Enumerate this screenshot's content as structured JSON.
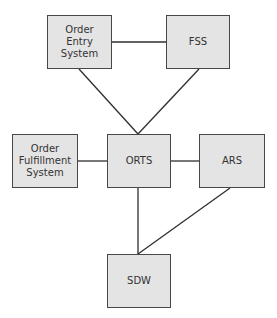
{
  "diagram": {
    "type": "system-architecture",
    "colors": {
      "node_fill": "#e4e4e4",
      "node_border": "#474747",
      "edge": "#2e2e2e",
      "text": "#333333"
    },
    "nodes": [
      {
        "id": "oes",
        "label": "Order\nEntry\nSystem",
        "x": 47,
        "y": 15,
        "w": 65,
        "h": 54
      },
      {
        "id": "fss",
        "label": "FSS",
        "x": 166,
        "y": 15,
        "w": 64,
        "h": 54
      },
      {
        "id": "ofs",
        "label": "Order\nFulfillment\nSystem",
        "x": 12,
        "y": 134,
        "w": 66,
        "h": 54
      },
      {
        "id": "orts",
        "label": "ORTS",
        "x": 107,
        "y": 134,
        "w": 64,
        "h": 54
      },
      {
        "id": "ars",
        "label": "ARS",
        "x": 199,
        "y": 134,
        "w": 66,
        "h": 54
      },
      {
        "id": "sdw",
        "label": "SDW",
        "x": 107,
        "y": 254,
        "w": 64,
        "h": 54
      }
    ],
    "edges": [
      {
        "from": "oes",
        "to": "fss",
        "x1": 112,
        "y1": 42,
        "x2": 166,
        "y2": 42
      },
      {
        "from": "oes",
        "to": "orts",
        "x1": 79,
        "y1": 69,
        "x2": 138,
        "y2": 134
      },
      {
        "from": "fss",
        "to": "orts",
        "x1": 199,
        "y1": 69,
        "x2": 138,
        "y2": 134
      },
      {
        "from": "ofs",
        "to": "orts",
        "x1": 78,
        "y1": 161,
        "x2": 107,
        "y2": 161
      },
      {
        "from": "orts",
        "to": "ars",
        "x1": 171,
        "y1": 161,
        "x2": 199,
        "y2": 161
      },
      {
        "from": "orts",
        "to": "sdw",
        "x1": 138,
        "y1": 188,
        "x2": 138,
        "y2": 254
      },
      {
        "from": "ars",
        "to": "sdw",
        "x1": 230,
        "y1": 188,
        "x2": 138,
        "y2": 254
      }
    ]
  }
}
